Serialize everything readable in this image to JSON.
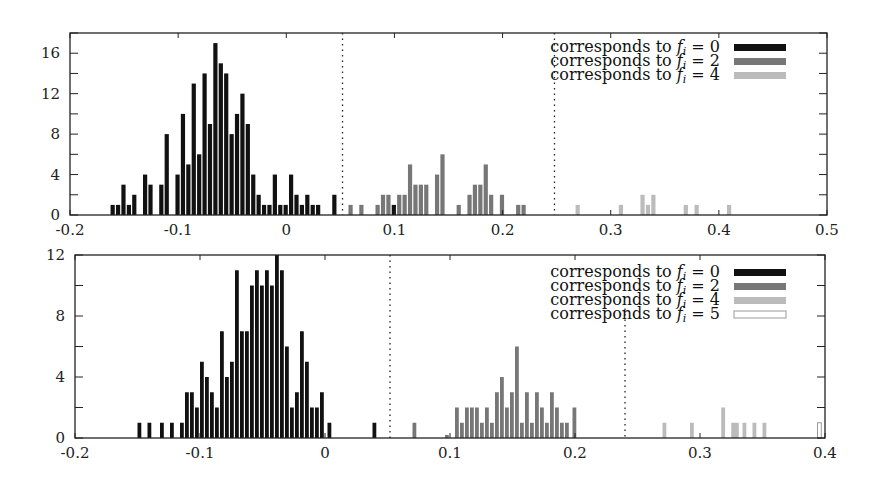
{
  "chart_data": [
    {
      "type": "bar",
      "title": "",
      "xlabel": "",
      "ylabel": "",
      "xlim": [
        -0.2,
        0.5
      ],
      "ylim": [
        0,
        18
      ],
      "xticks": [
        "-0.2",
        "-0.1",
        "0",
        "0.1",
        "0.2",
        "0.3",
        "0.4",
        "0.5"
      ],
      "yticks": [
        "0",
        "4",
        "8",
        "12",
        "16"
      ],
      "grid": false,
      "legend_position": "top-right",
      "thresholds": [
        0.052,
        0.248
      ],
      "bin_width": 0.005,
      "series": [
        {
          "name": "corresponds to f_i = 0",
          "color": "#111111",
          "x": [
            -0.16,
            -0.155,
            -0.15,
            -0.145,
            -0.14,
            -0.13,
            -0.125,
            -0.115,
            -0.11,
            -0.1,
            -0.095,
            -0.09,
            -0.085,
            -0.08,
            -0.075,
            -0.07,
            -0.065,
            -0.06,
            -0.055,
            -0.05,
            -0.045,
            -0.04,
            -0.035,
            -0.03,
            -0.025,
            -0.02,
            -0.015,
            -0.01,
            -0.005,
            0.0,
            0.005,
            0.01,
            0.015,
            0.02,
            0.025,
            0.03,
            0.045,
            0.1
          ],
          "values": [
            1,
            1,
            3,
            1,
            2,
            4,
            3,
            3,
            8,
            4,
            10,
            5,
            13,
            6,
            14,
            9,
            17,
            15,
            14,
            8,
            10,
            12,
            9,
            4,
            2,
            1,
            1,
            4,
            1,
            1,
            4,
            2,
            1,
            2,
            1,
            1,
            2,
            1
          ]
        },
        {
          "name": "corresponds to f_i = 2",
          "color": "#777777",
          "x": [
            0.06,
            0.07,
            0.085,
            0.09,
            0.095,
            0.105,
            0.11,
            0.115,
            0.12,
            0.125,
            0.13,
            0.14,
            0.145,
            0.16,
            0.17,
            0.175,
            0.18,
            0.185,
            0.19,
            0.2,
            0.215,
            0.22
          ],
          "values": [
            1,
            1,
            1,
            2,
            2,
            2,
            2,
            5,
            3,
            3,
            3,
            4,
            6,
            1,
            2,
            3,
            3,
            5,
            2,
            2,
            1,
            1
          ]
        },
        {
          "name": "corresponds to f_i = 4",
          "color": "#bbbbbb",
          "x": [
            0.27,
            0.31,
            0.33,
            0.335,
            0.34,
            0.37,
            0.38,
            0.41
          ],
          "values": [
            1,
            1,
            2,
            1,
            2,
            1,
            1,
            1
          ]
        }
      ]
    },
    {
      "type": "bar",
      "title": "",
      "xlabel": "",
      "ylabel": "",
      "xlim": [
        -0.2,
        0.4
      ],
      "ylim": [
        0,
        12
      ],
      "xticks": [
        "-0.2",
        "-0.1",
        "0",
        "0.1",
        "0.2",
        "0.3",
        "0.4"
      ],
      "yticks": [
        "0",
        "4",
        "8",
        "12"
      ],
      "grid": false,
      "legend_position": "top-right",
      "thresholds": [
        0.052,
        0.24
      ],
      "bin_width": 0.004,
      "series": [
        {
          "name": "corresponds to f_i = 0",
          "color": "#111111",
          "x": [
            -0.148,
            -0.14,
            -0.13,
            -0.122,
            -0.114,
            -0.11,
            -0.106,
            -0.102,
            -0.098,
            -0.094,
            -0.09,
            -0.086,
            -0.082,
            -0.078,
            -0.074,
            -0.07,
            -0.066,
            -0.062,
            -0.058,
            -0.054,
            -0.05,
            -0.046,
            -0.042,
            -0.038,
            -0.034,
            -0.03,
            -0.026,
            -0.022,
            -0.018,
            -0.014,
            -0.01,
            -0.006,
            -0.002,
            0.004,
            0.04
          ],
          "values": [
            1,
            1,
            1,
            1,
            1,
            3,
            3,
            2,
            5,
            4,
            3,
            2,
            7,
            4,
            5,
            11,
            7,
            7,
            10,
            11,
            10,
            11,
            10,
            12,
            11,
            6,
            2,
            3,
            7,
            5,
            2,
            2,
            3,
            1,
            1
          ]
        },
        {
          "name": "corresponds to f_i = 2",
          "color": "#777777",
          "x": [
            0.072,
            0.098,
            0.106,
            0.11,
            0.114,
            0.118,
            0.122,
            0.126,
            0.13,
            0.134,
            0.138,
            0.142,
            0.146,
            0.15,
            0.154,
            0.158,
            0.162,
            0.166,
            0.17,
            0.174,
            0.178,
            0.182,
            0.186,
            0.19,
            0.194,
            0.2
          ],
          "values": [
            1,
            0.2,
            2,
            1,
            2,
            2,
            2,
            1,
            2,
            1,
            3,
            4,
            2,
            3,
            6,
            1,
            3,
            1,
            3,
            2,
            1,
            3,
            2,
            1,
            1,
            2
          ]
        },
        {
          "name": "corresponds to f_i = 4",
          "color": "#bbbbbb",
          "x": [
            0.272,
            0.294,
            0.319,
            0.327,
            0.33,
            0.336,
            0.344,
            0.352
          ],
          "values": [
            1,
            1,
            2,
            1,
            1,
            1,
            1,
            1
          ]
        },
        {
          "name": "corresponds to f_i = 5",
          "color": "#ffffff",
          "x": [
            0.396
          ],
          "values": [
            1
          ]
        }
      ]
    }
  ],
  "legend": {
    "top": [
      {
        "prefix": "corresponds to ",
        "var": "f",
        "sub": "i",
        "eq": " = 0",
        "color": "#111111"
      },
      {
        "prefix": "corresponds to ",
        "var": "f",
        "sub": "i",
        "eq": " = 2",
        "color": "#777777"
      },
      {
        "prefix": "corresponds to ",
        "var": "f",
        "sub": "i",
        "eq": " = 4",
        "color": "#bbbbbb"
      }
    ],
    "bottom": [
      {
        "prefix": "corresponds to ",
        "var": "f",
        "sub": "i",
        "eq": " = 0",
        "color": "#111111"
      },
      {
        "prefix": "corresponds to ",
        "var": "f",
        "sub": "i",
        "eq": " = 2",
        "color": "#777777"
      },
      {
        "prefix": "corresponds to ",
        "var": "f",
        "sub": "i",
        "eq": " = 4",
        "color": "#bbbbbb"
      },
      {
        "prefix": "corresponds to ",
        "var": "f",
        "sub": "i",
        "eq": " = 5",
        "color": "#ffffff"
      }
    ]
  }
}
